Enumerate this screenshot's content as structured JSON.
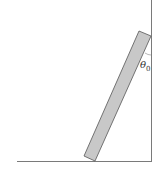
{
  "diagram": {
    "colors": {
      "background": "#ffffff",
      "lines": "#7a7a7a",
      "rod_fill": "#c8c8c8",
      "rod_stroke": "#555555"
    },
    "angle_label": {
      "symbol": "θ",
      "subscript": "0"
    }
  }
}
